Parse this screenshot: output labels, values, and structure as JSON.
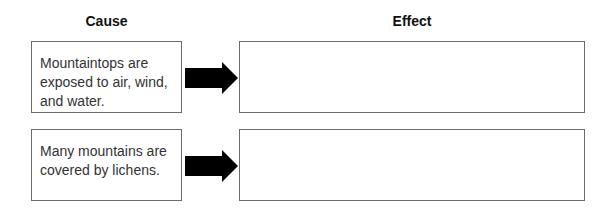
{
  "headings": {
    "cause": "Cause",
    "effect": "Effect"
  },
  "rows": [
    {
      "cause_text": "Mountaintops are exposed to air, wind, and water.",
      "effect_text": ""
    },
    {
      "cause_text": "Many mountains are covered by lichens.",
      "effect_text": ""
    }
  ],
  "icons": {
    "arrow": "right-arrow-icon"
  },
  "colors": {
    "border": "#6b6b6b",
    "arrow": "#000000",
    "text": "#333333"
  }
}
